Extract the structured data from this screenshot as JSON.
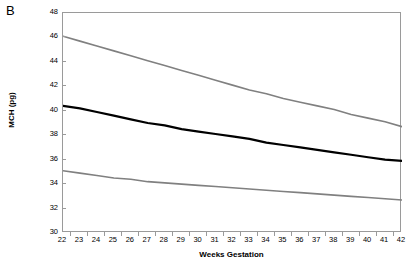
{
  "panel": {
    "label": "B"
  },
  "chart_data": {
    "type": "line",
    "title": "",
    "xlabel": "Weeks Gestation",
    "ylabel": "MCH (pg)",
    "xlim": [
      22,
      42
    ],
    "ylim": [
      30,
      48
    ],
    "grid": false,
    "legend": "none",
    "xticks": [
      22,
      23,
      24,
      25,
      26,
      27,
      28,
      29,
      30,
      31,
      32,
      33,
      34,
      35,
      36,
      37,
      38,
      39,
      40,
      41,
      42
    ],
    "yticks": [
      30,
      32,
      34,
      36,
      38,
      40,
      42,
      44,
      46,
      48
    ],
    "x": [
      22,
      23,
      24,
      25,
      26,
      27,
      28,
      29,
      30,
      31,
      32,
      33,
      34,
      35,
      36,
      37,
      38,
      39,
      40,
      41,
      42
    ],
    "series": [
      {
        "name": "Upper reference limit",
        "color": "#808080",
        "width": 1.6,
        "values": [
          46.1,
          45.7,
          45.3,
          44.9,
          44.5,
          44.1,
          43.7,
          43.3,
          42.9,
          42.5,
          42.1,
          41.7,
          41.4,
          41.0,
          40.7,
          40.4,
          40.1,
          39.7,
          39.4,
          39.1,
          38.7
        ]
      },
      {
        "name": "Median",
        "color": "#000000",
        "width": 2.2,
        "values": [
          40.4,
          40.2,
          39.9,
          39.6,
          39.3,
          39.0,
          38.8,
          38.5,
          38.3,
          38.1,
          37.9,
          37.7,
          37.4,
          37.2,
          37.0,
          36.8,
          36.6,
          36.4,
          36.2,
          36.0,
          35.9
        ]
      },
      {
        "name": "Lower reference limit",
        "color": "#808080",
        "width": 1.6,
        "values": [
          35.1,
          34.9,
          34.7,
          34.5,
          34.4,
          34.2,
          34.1,
          34.0,
          33.9,
          33.8,
          33.7,
          33.6,
          33.5,
          33.4,
          33.3,
          33.2,
          33.1,
          33.0,
          32.9,
          32.8,
          32.7
        ]
      }
    ]
  }
}
